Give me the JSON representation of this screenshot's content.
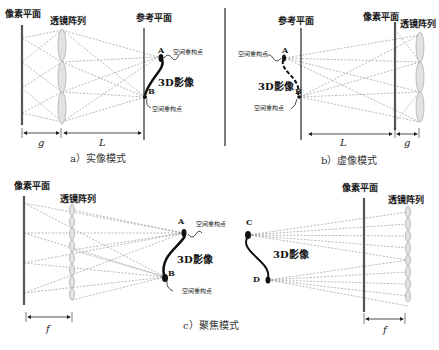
{
  "panels": {
    "a": {
      "pixel_plane_label": "像素平面",
      "lens_array_label": "透镜阵列",
      "reference_plane_label": "参考平面",
      "point_a": "A",
      "point_b": "B",
      "reconstruction_point_a": "空间重构点",
      "reconstruction_point_b": "空间重构点",
      "image_label": "3D影像",
      "dim_g": "g",
      "dim_l": "L",
      "caption": "a）实像模式"
    },
    "b": {
      "reference_plane_label": "参考平面",
      "pixel_plane_label": "像素平面",
      "lens_array_label": "透镜阵列",
      "point_a": "A",
      "point_b": "B",
      "reconstruction_point_a": "空间重构点",
      "reconstruction_point_b": "空间重构点",
      "image_label": "3D影像",
      "dim_l": "L",
      "dim_g": "g",
      "caption": "b）虚像模式"
    },
    "c": {
      "left_pixel_plane_label": "像素平面",
      "left_lens_array_label": "透镜阵列",
      "right_pixel_plane_label": "像素平面",
      "right_lens_array_label": "透镜阵列",
      "point_a": "A",
      "point_b": "B",
      "point_c": "C",
      "point_d": "D",
      "reconstruction_point_a": "空间重构点",
      "reconstruction_point_b": "空间重构点",
      "image_label_left": "3D影像",
      "image_label_right": "3D影像",
      "dim_f_left": "f",
      "dim_f_right": "f",
      "caption": "c）聚焦模式"
    }
  },
  "colors": {
    "pixel_plane": "#555555",
    "lens": "#e2e2e2",
    "ray": "#8a8a8a",
    "text": "#1a1a1a"
  }
}
